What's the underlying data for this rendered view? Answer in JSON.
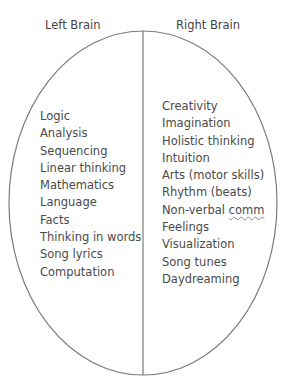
{
  "diagram": {
    "type": "brain-hemisphere-comparison",
    "shape": "ellipse divided vertically",
    "colors": {
      "outline": "#7a7a7a",
      "text": "#4a4a4a",
      "background": "#ffffff"
    },
    "left": {
      "title": "Left Brain",
      "items": [
        "Logic",
        "Analysis",
        "Sequencing",
        "Linear thinking",
        "Mathematics",
        "Language",
        "Facts",
        "Thinking in words",
        "Song lyrics",
        "Computation"
      ]
    },
    "right": {
      "title": "Right Brain",
      "items": [
        "Creativity",
        "Imagination",
        "Holistic thinking",
        "Intuition",
        "Arts (motor skills)",
        "Rhythm (beats)",
        "Non-verbal comm",
        "Feelings",
        "Visualization",
        "Song tunes",
        "Daydreaming"
      ]
    }
  }
}
